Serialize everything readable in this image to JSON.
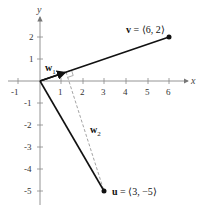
{
  "axes": {
    "x_label": "x",
    "y_label": "y",
    "x_ticks": [
      "-1",
      "1",
      "2",
      "3",
      "4",
      "5",
      "6"
    ],
    "y_ticks": [
      "2",
      "1",
      "-1",
      "-2",
      "-3",
      "-4",
      "-5"
    ]
  },
  "vectors": {
    "v": {
      "name": "v",
      "eq": " = ⟨6, 2⟩",
      "components": [
        6,
        2
      ]
    },
    "u": {
      "name": "u",
      "eq": " = ⟨3, −5⟩",
      "components": [
        3,
        -5
      ]
    },
    "w1": {
      "name": "w",
      "sub": "1",
      "components": [
        1.2,
        0.4
      ]
    },
    "w2": {
      "name": "w",
      "sub": "2",
      "components": [
        1.8,
        -5.4
      ]
    }
  }
}
